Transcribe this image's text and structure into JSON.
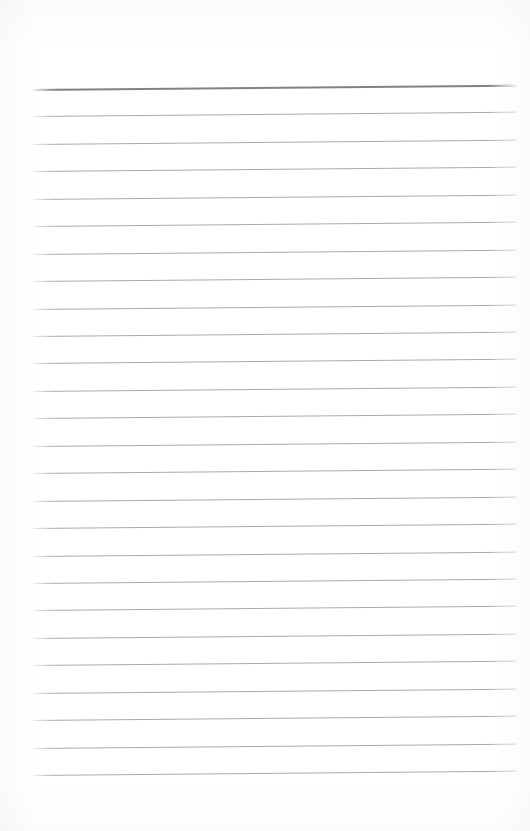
{
  "document": {
    "type": "blank-ruled-notebook-paper",
    "page_width": 530,
    "page_height": 831,
    "background_color": "#ffffff",
    "text_content": "",
    "visible_text": ""
  },
  "ruling": {
    "line_color": "#9c9c9e",
    "header_line_color": "#828285",
    "line_count": 26,
    "first_line_y": 89,
    "last_line_y": 775,
    "line_spacing": 27.44,
    "left_x": 30,
    "right_x": 516,
    "tilt_degrees": -0.5,
    "top_margin": 89,
    "bottom_margin": 56,
    "left_margin": 30,
    "right_margin": 14
  },
  "lines": [
    {
      "index": 1,
      "y": 89,
      "thickness": 2.0,
      "color": "#828285",
      "emphasis": "header"
    },
    {
      "index": 2,
      "y": 116,
      "thickness": 1.0,
      "color": "#9c9c9e",
      "emphasis": "normal"
    },
    {
      "index": 3,
      "y": 144,
      "thickness": 1.0,
      "color": "#9c9c9e",
      "emphasis": "normal"
    },
    {
      "index": 4,
      "y": 171,
      "thickness": 1.0,
      "color": "#9c9c9e",
      "emphasis": "normal"
    },
    {
      "index": 5,
      "y": 199,
      "thickness": 1.0,
      "color": "#9c9c9e",
      "emphasis": "normal"
    },
    {
      "index": 6,
      "y": 226,
      "thickness": 1.0,
      "color": "#9c9c9e",
      "emphasis": "normal"
    },
    {
      "index": 7,
      "y": 254,
      "thickness": 1.0,
      "color": "#9c9c9e",
      "emphasis": "normal"
    },
    {
      "index": 8,
      "y": 281,
      "thickness": 1.0,
      "color": "#9c9c9e",
      "emphasis": "normal"
    },
    {
      "index": 9,
      "y": 309,
      "thickness": 1.0,
      "color": "#9c9c9e",
      "emphasis": "normal"
    },
    {
      "index": 10,
      "y": 336,
      "thickness": 1.0,
      "color": "#9c9c9e",
      "emphasis": "normal"
    },
    {
      "index": 11,
      "y": 363,
      "thickness": 1.0,
      "color": "#9c9c9e",
      "emphasis": "normal"
    },
    {
      "index": 12,
      "y": 391,
      "thickness": 1.0,
      "color": "#9c9c9e",
      "emphasis": "normal"
    },
    {
      "index": 13,
      "y": 418,
      "thickness": 1.0,
      "color": "#9c9c9e",
      "emphasis": "normal"
    },
    {
      "index": 14,
      "y": 446,
      "thickness": 1.0,
      "color": "#9c9c9e",
      "emphasis": "normal"
    },
    {
      "index": 15,
      "y": 473,
      "thickness": 1.0,
      "color": "#9c9c9e",
      "emphasis": "normal"
    },
    {
      "index": 16,
      "y": 501,
      "thickness": 1.0,
      "color": "#9c9c9e",
      "emphasis": "normal"
    },
    {
      "index": 17,
      "y": 528,
      "thickness": 1.0,
      "color": "#9c9c9e",
      "emphasis": "normal"
    },
    {
      "index": 18,
      "y": 556,
      "thickness": 1.0,
      "color": "#9c9c9e",
      "emphasis": "normal"
    },
    {
      "index": 19,
      "y": 583,
      "thickness": 1.0,
      "color": "#9c9c9e",
      "emphasis": "normal"
    },
    {
      "index": 20,
      "y": 610,
      "thickness": 1.0,
      "color": "#9c9c9e",
      "emphasis": "normal"
    },
    {
      "index": 21,
      "y": 638,
      "thickness": 1.0,
      "color": "#9c9c9e",
      "emphasis": "normal"
    },
    {
      "index": 22,
      "y": 665,
      "thickness": 1.0,
      "color": "#9c9c9e",
      "emphasis": "normal"
    },
    {
      "index": 23,
      "y": 693,
      "thickness": 1.0,
      "color": "#9c9c9e",
      "emphasis": "normal"
    },
    {
      "index": 24,
      "y": 720,
      "thickness": 1.0,
      "color": "#9c9c9e",
      "emphasis": "normal"
    },
    {
      "index": 25,
      "y": 748,
      "thickness": 1.0,
      "color": "#9c9c9e",
      "emphasis": "normal"
    },
    {
      "index": 26,
      "y": 775,
      "thickness": 1.0,
      "color": "#9c9c9e",
      "emphasis": "normal"
    }
  ]
}
